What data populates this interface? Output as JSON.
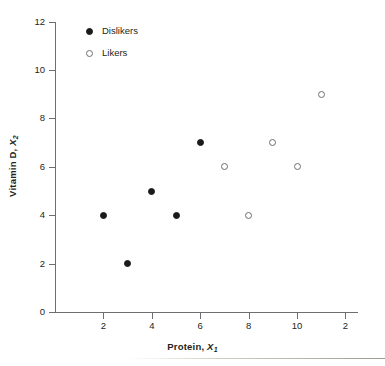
{
  "chart_data": {
    "type": "scatter",
    "title": "",
    "xlabel": "Protein, X₁",
    "ylabel": "Vitamin D, X₂",
    "xlabel_text": "Protein,",
    "xlabel_var": "X",
    "xlabel_sub": "1",
    "ylabel_text": "Vitamin D,",
    "ylabel_var": "X",
    "ylabel_sub": "2",
    "xlim": [
      0,
      12.6
    ],
    "ylim": [
      0,
      12
    ],
    "xticks": [
      "2",
      "4",
      "6",
      "8",
      "10",
      "2"
    ],
    "xtick_values": [
      2,
      4,
      6,
      8,
      10,
      12
    ],
    "yticks": [
      "0",
      "2",
      "4",
      "6",
      "8",
      "10",
      "12"
    ],
    "ytick_values": [
      0,
      2,
      4,
      6,
      8,
      10,
      12
    ],
    "grid": false,
    "legend_position": "upper-left-inside",
    "series": [
      {
        "name": "Dislikers",
        "marker": "filled-circle",
        "color": "#1a1a1a",
        "points": [
          {
            "x": 2,
            "y": 4
          },
          {
            "x": 3,
            "y": 2
          },
          {
            "x": 4,
            "y": 5
          },
          {
            "x": 5,
            "y": 4
          },
          {
            "x": 6,
            "y": 7
          }
        ]
      },
      {
        "name": "Likers",
        "marker": "open-circle",
        "color": "#ffffff",
        "edge_color": "#6d6e71",
        "points": [
          {
            "x": 7,
            "y": 6
          },
          {
            "x": 8,
            "y": 4
          },
          {
            "x": 9,
            "y": 7
          },
          {
            "x": 10,
            "y": 6
          },
          {
            "x": 11,
            "y": 9
          }
        ]
      }
    ]
  },
  "legend": {
    "items": [
      {
        "label": "Dislikers",
        "marker": "filled-circle"
      },
      {
        "label": "Likers",
        "marker": "open-circle"
      }
    ]
  },
  "colors": {
    "axis": "#6d6e71",
    "text": "#231f20",
    "marker_fill": "#1a1a1a",
    "marker_edge": "#6d6e71",
    "background": "#ffffff"
  }
}
